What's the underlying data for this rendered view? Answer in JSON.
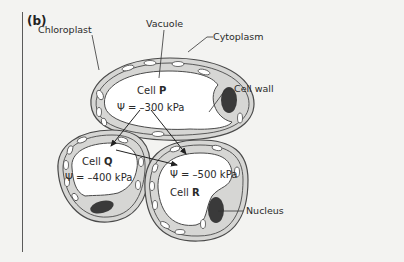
{
  "figure": {
    "panel_label": "(b)",
    "labels": {
      "chloroplast": "Chloroplast",
      "vacuole": "Vacuole",
      "cytoplasm": "Cytoplasm",
      "cell_wall": "Cell wall",
      "nucleus": "Nucleus"
    },
    "cells": [
      {
        "id": "P",
        "name_prefix": "Cell ",
        "name_letter": "P",
        "potential": "Ψ = –300 kPa"
      },
      {
        "id": "Q",
        "name_prefix": "Cell ",
        "name_letter": "Q",
        "potential": "Ψ = –400 kPa"
      },
      {
        "id": "R",
        "name_prefix": "Cell ",
        "name_letter": "R",
        "potential": "Ψ = –500 kPa"
      }
    ],
    "arrows": [
      {
        "from": "P",
        "to": "Q"
      },
      {
        "from": "P",
        "to": "R"
      },
      {
        "from": "Q",
        "to": "R"
      }
    ],
    "colors": {
      "background": "#f3f3f1",
      "cytoplasm": "#d6d6d4",
      "vacuole": "#ffffff",
      "nucleus": "#3a3a3a",
      "outline": "#4a4a4a"
    }
  }
}
